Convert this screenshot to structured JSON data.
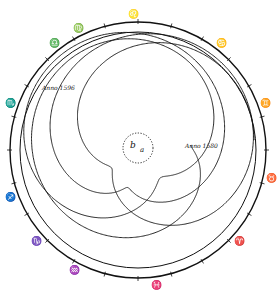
{
  "figure": {
    "center_labels": {
      "b": "b",
      "a": "a"
    },
    "annotations": [
      {
        "id": "anno-1596",
        "text": "Anno 1596",
        "x": 40,
        "y": 80
      },
      {
        "id": "anno-1580",
        "text": "Anno 1580",
        "x": 183,
        "y": 140
      }
    ],
    "zodiac_signs": [
      {
        "name": "leo",
        "glyph": "♌",
        "angle": -92
      },
      {
        "name": "cancer",
        "glyph": "♋",
        "angle": -52
      },
      {
        "name": "gemini",
        "glyph": "♊",
        "angle": -20
      },
      {
        "name": "taurus",
        "glyph": "♉",
        "angle": 12
      },
      {
        "name": "aries",
        "glyph": "♈",
        "angle": 42
      },
      {
        "name": "pisces",
        "glyph": "♓",
        "angle": 82
      },
      {
        "name": "aquarius",
        "glyph": "♒",
        "angle": 118
      },
      {
        "name": "capricorn",
        "glyph": "♑",
        "angle": 138
      },
      {
        "name": "sagittarius",
        "glyph": "♐",
        "angle": 160
      },
      {
        "name": "scorpio",
        "glyph": "♏",
        "angle": 200
      },
      {
        "name": "libra",
        "glyph": "♎",
        "angle": 232
      },
      {
        "name": "virgo",
        "glyph": "♍",
        "angle": 244
      }
    ]
  }
}
